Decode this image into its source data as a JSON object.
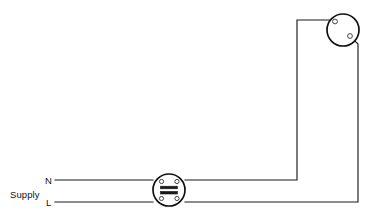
{
  "diagram": {
    "background_color": "#ffffff",
    "wire_color": "#1a1a1a",
    "device_outline_color": "#111111",
    "width": 372,
    "height": 224,
    "labels": {
      "supply": "Supply",
      "neutral": "N",
      "live": "L"
    },
    "components": [
      {
        "name": "junction-box",
        "kind": "junction box with connector bars",
        "cx": 169,
        "cy": 190,
        "r": 16,
        "terminal_count": 4,
        "bar_count": 2
      },
      {
        "name": "lamp-holder",
        "kind": "lamp holder / ceiling rose",
        "cx": 343,
        "cy": 30,
        "r": 16,
        "terminal_count": 2
      }
    ],
    "wires": [
      {
        "name": "neutral-supply-wire",
        "from": "supply N",
        "to": "junction box left",
        "path": "M55,180 L153,180"
      },
      {
        "name": "live-supply-wire",
        "from": "supply L",
        "to": "junction box left",
        "path": "M55,202 L153,202"
      },
      {
        "name": "neutral-to-lamp-wire",
        "from": "junction box right",
        "to": "lamp upper terminal",
        "path": "M185,180 L297,180 L297,20 L330,20"
      },
      {
        "name": "live-return-wire",
        "from": "junction box right",
        "to": "lamp lower terminal",
        "path": "M185,202 L358,202 L358,43 L352,38"
      }
    ]
  }
}
